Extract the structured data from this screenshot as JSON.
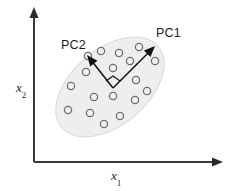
{
  "figure": {
    "type": "scatter-with-pca-axes",
    "width": 230,
    "height": 191,
    "background_color": "#ffffff"
  },
  "axes": {
    "x_axis": {
      "label": "x",
      "subscript": "1",
      "name": "x1-axis",
      "color": "#3a3a3a",
      "origin": [
        34,
        162
      ],
      "tip": [
        222,
        162
      ],
      "label_position": [
        111,
        169
      ]
    },
    "y_axis": {
      "label": "x",
      "subscript": "2",
      "name": "x2-axis",
      "color": "#3a3a3a",
      "origin": [
        34,
        162
      ],
      "tip": [
        34,
        8
      ],
      "label_position": [
        16,
        81
      ]
    }
  },
  "cluster": {
    "name": "data-ellipse",
    "fill_color": "#eeeeee",
    "stroke_color": "#d8d8d8",
    "center": [
      110,
      87
    ],
    "rx": 63,
    "ry": 38,
    "rotation_deg": -40
  },
  "data_points": {
    "marker": "open-circle",
    "stroke_color": "#6e6e6e",
    "fill_color": "#f4f4f4",
    "radius": 3.6,
    "count": 18,
    "coordinates": [
      [
        101,
        51
      ],
      [
        139,
        47
      ],
      [
        119,
        53
      ],
      [
        155,
        61
      ],
      [
        113,
        68
      ],
      [
        86,
        72
      ],
      [
        71,
        86
      ],
      [
        136,
        80
      ],
      [
        94,
        97
      ],
      [
        113,
        96
      ],
      [
        135,
        100
      ],
      [
        68,
        110
      ],
      [
        90,
        113
      ],
      [
        120,
        116
      ],
      [
        104,
        124
      ],
      [
        147,
        91
      ],
      [
        88,
        56
      ],
      [
        130,
        61
      ]
    ]
  },
  "vectors": [
    {
      "name": "pc1-arrow",
      "label": "PC1",
      "from": [
        113,
        88
      ],
      "to": [
        155,
        46
      ],
      "label_position": [
        156,
        27
      ],
      "color": "#111111"
    },
    {
      "name": "pc2-arrow",
      "label": "PC2",
      "from": [
        113,
        88
      ],
      "to": [
        87,
        55
      ],
      "label_position": [
        61,
        39
      ],
      "color": "#111111"
    }
  ],
  "right_angle_marker": {
    "name": "right-angle-marker",
    "vertex": [
      113,
      88
    ],
    "size": 7,
    "color": "#111111"
  }
}
